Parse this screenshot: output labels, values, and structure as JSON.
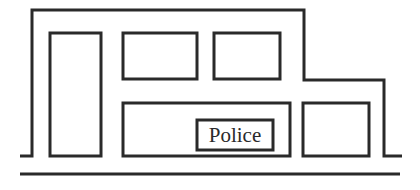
{
  "diagram": {
    "sign": {
      "label": "Police"
    },
    "colors": {
      "line": "#2a2a2a",
      "background": "#ffffff"
    },
    "elements": [
      "building-outline",
      "door",
      "upper-window-left",
      "upper-window-right",
      "storefront-window",
      "police-sign",
      "side-window",
      "ground-line"
    ]
  }
}
